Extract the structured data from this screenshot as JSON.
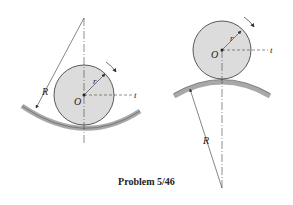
{
  "caption": "Problem 5/46",
  "colors": {
    "disk_fill": "#dcdcdc",
    "track_fill": "#a8a8a8",
    "line": "#333333"
  },
  "figures": [
    {
      "id": "concave-track",
      "labels": {
        "R": "R",
        "r": "r",
        "O": "O",
        "t": "t"
      }
    },
    {
      "id": "convex-track",
      "labels": {
        "R": "R",
        "r": "r",
        "O": "O",
        "t": "t"
      }
    }
  ]
}
